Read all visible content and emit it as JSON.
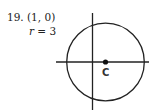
{
  "problem": {
    "number": "19.",
    "center_text": "(1, 0)",
    "radius_var": "r",
    "radius_eq": " = 3"
  },
  "diagram": {
    "center_label": "C",
    "center": [
      1,
      0
    ],
    "radius": 3,
    "line_color": "#222222"
  }
}
